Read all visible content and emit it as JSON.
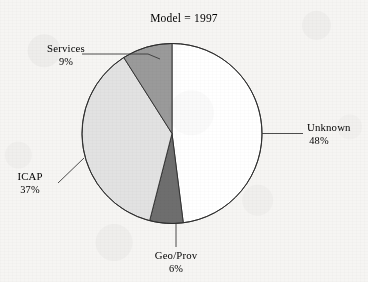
{
  "figure": {
    "title": "Model = 1997",
    "background_color": "#f6f5f3",
    "outline_color": "#2e2e2e",
    "text_color": "#1d1d1d"
  },
  "labels": {
    "services_name": "Services",
    "services_pct": "9%",
    "unknown_name": "Unknown",
    "unknown_pct": "48%",
    "icap_name": "ICAP",
    "icap_pct": "37%",
    "geoprov_name": "Geo/Prov",
    "geoprov_pct": "6%"
  },
  "chart_data": {
    "type": "pie",
    "title": "Model = 1997",
    "xlabel": "",
    "ylabel": "",
    "grid": false,
    "legend": "none",
    "label_style": "outside-with-leader-lines",
    "start_angle_deg": 90,
    "direction": "clockwise",
    "total_pct": 100,
    "categories": [
      "Unknown",
      "Geo/Prov",
      "ICAP",
      "Services"
    ],
    "values": [
      48,
      6,
      37,
      9
    ],
    "value_unit": "percent",
    "colors": [
      "#ffffff",
      "#6e6e6e",
      "#e2e2e2",
      "#9a9a9a"
    ],
    "slices": [
      {
        "name": "Unknown",
        "value": 48,
        "label": "Unknown",
        "pct_label": "48%",
        "color": "#ffffff",
        "label_position": "right"
      },
      {
        "name": "Geo/Prov",
        "value": 6,
        "label": "Geo/Prov",
        "pct_label": "6%",
        "color": "#6e6e6e",
        "label_position": "bottom"
      },
      {
        "name": "ICAP",
        "value": 37,
        "label": "ICAP",
        "pct_label": "37%",
        "color": "#e2e2e2",
        "label_position": "left"
      },
      {
        "name": "Services",
        "value": 9,
        "label": "Services",
        "pct_label": "9%",
        "color": "#9a9a9a",
        "label_position": "upper-left"
      }
    ]
  }
}
